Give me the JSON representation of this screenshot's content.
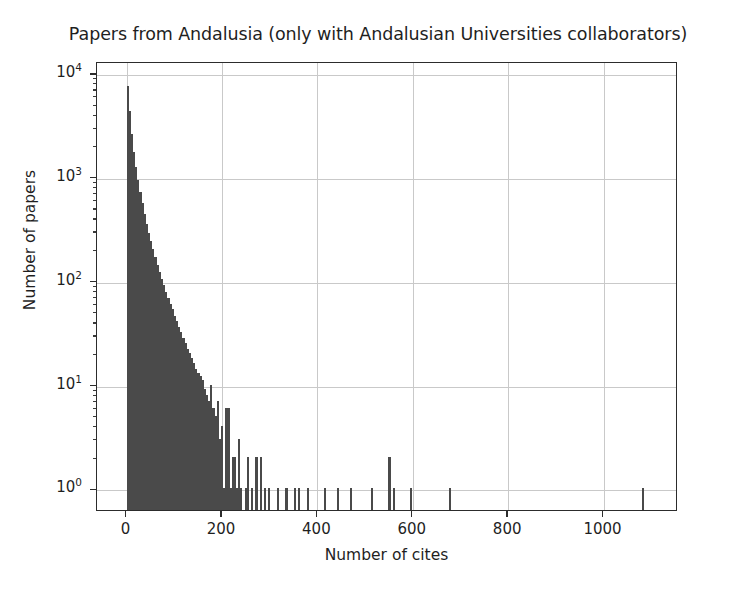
{
  "chart_data": {
    "type": "bar",
    "title": "Papers from Andalusia (only with Andalusian Universities collaborators)",
    "xlabel": "Number of cites",
    "ylabel": "Number of papers",
    "yscale": "log",
    "xscale": "linear",
    "grid": true,
    "legend": null,
    "bar_color": "#4a4a4a",
    "xlim": [
      -62,
      1156
    ],
    "ylim": [
      0.62,
      13000
    ],
    "xticks": [
      0,
      200,
      400,
      600,
      800,
      1000
    ],
    "xtick_labels": [
      "0",
      "200",
      "400",
      "600",
      "800",
      "1000"
    ],
    "yticks": [
      1,
      10,
      100,
      1000,
      10000
    ],
    "ytick_labels": [
      "10⁰",
      "10¹",
      "10²",
      "10³",
      "10⁴"
    ],
    "ytick_mantissa": [
      "10",
      "10",
      "10",
      "10",
      "10"
    ],
    "ytick_exponent": [
      "0",
      "1",
      "2",
      "3",
      "4"
    ],
    "bin_width": 4.5,
    "bins": [
      {
        "x": 0,
        "count": 7400
      },
      {
        "x": 4.5,
        "count": 4300
      },
      {
        "x": 9,
        "count": 2600
      },
      {
        "x": 13.5,
        "count": 1750
      },
      {
        "x": 18,
        "count": 1250
      },
      {
        "x": 22.5,
        "count": 940
      },
      {
        "x": 27,
        "count": 720
      },
      {
        "x": 31.5,
        "count": 560
      },
      {
        "x": 36,
        "count": 440
      },
      {
        "x": 40.5,
        "count": 350
      },
      {
        "x": 45,
        "count": 290
      },
      {
        "x": 49.5,
        "count": 240
      },
      {
        "x": 54,
        "count": 200
      },
      {
        "x": 58.5,
        "count": 168
      },
      {
        "x": 63,
        "count": 142
      },
      {
        "x": 67.5,
        "count": 120
      },
      {
        "x": 72,
        "count": 104
      },
      {
        "x": 76.5,
        "count": 90
      },
      {
        "x": 81,
        "count": 78
      },
      {
        "x": 85.5,
        "count": 68
      },
      {
        "x": 90,
        "count": 60
      },
      {
        "x": 94.5,
        "count": 53
      },
      {
        "x": 99,
        "count": 46
      },
      {
        "x": 103.5,
        "count": 41
      },
      {
        "x": 108,
        "count": 36
      },
      {
        "x": 112.5,
        "count": 32
      },
      {
        "x": 117,
        "count": 28
      },
      {
        "x": 121.5,
        "count": 25
      },
      {
        "x": 126,
        "count": 22
      },
      {
        "x": 130.5,
        "count": 20
      },
      {
        "x": 135,
        "count": 18
      },
      {
        "x": 139.5,
        "count": 16
      },
      {
        "x": 144,
        "count": 14
      },
      {
        "x": 148.5,
        "count": 13
      },
      {
        "x": 153,
        "count": 12
      },
      {
        "x": 157.5,
        "count": 11
      },
      {
        "x": 162,
        "count": 9
      },
      {
        "x": 166.5,
        "count": 8
      },
      {
        "x": 171,
        "count": 7
      },
      {
        "x": 175.5,
        "count": 10
      },
      {
        "x": 180,
        "count": 6
      },
      {
        "x": 184.5,
        "count": 5
      },
      {
        "x": 189,
        "count": 7
      },
      {
        "x": 193.5,
        "count": 3
      },
      {
        "x": 198,
        "count": 4
      },
      {
        "x": 202.5,
        "count": 1
      },
      {
        "x": 207,
        "count": 6
      },
      {
        "x": 211.5,
        "count": 6
      },
      {
        "x": 216,
        "count": 1
      },
      {
        "x": 220.5,
        "count": 2
      },
      {
        "x": 225,
        "count": 2
      },
      {
        "x": 229.5,
        "count": 1
      },
      {
        "x": 234,
        "count": 3
      },
      {
        "x": 238.5,
        "count": 1
      },
      {
        "x": 247.5,
        "count": 1
      },
      {
        "x": 252,
        "count": 2
      },
      {
        "x": 261,
        "count": 1
      },
      {
        "x": 270,
        "count": 2
      },
      {
        "x": 279,
        "count": 2
      },
      {
        "x": 288,
        "count": 1
      },
      {
        "x": 297,
        "count": 1
      },
      {
        "x": 315,
        "count": 1
      },
      {
        "x": 333,
        "count": 1
      },
      {
        "x": 351,
        "count": 1
      },
      {
        "x": 360,
        "count": 1
      },
      {
        "x": 378,
        "count": 1
      },
      {
        "x": 414,
        "count": 1
      },
      {
        "x": 441,
        "count": 1
      },
      {
        "x": 468,
        "count": 1
      },
      {
        "x": 513,
        "count": 1
      },
      {
        "x": 549,
        "count": 2
      },
      {
        "x": 558,
        "count": 1
      },
      {
        "x": 594,
        "count": 1
      },
      {
        "x": 675,
        "count": 1
      },
      {
        "x": 1080,
        "count": 1
      }
    ]
  }
}
